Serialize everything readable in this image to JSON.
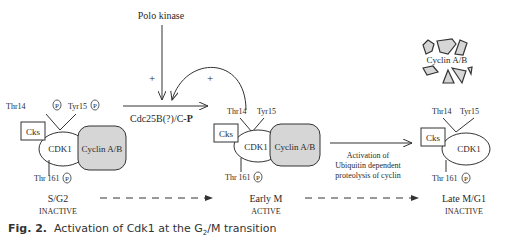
{
  "figure": {
    "caption": {
      "label": "Fig. 2.",
      "text_before": "Activation of Cdk1 at the G",
      "subscript": "2",
      "text_after": "/M transition"
    },
    "regulators": {
      "polo_kinase": "Polo kinase",
      "phosphatase": "Cdc25B(?)/C-",
      "phosphatase_bold": "P",
      "plus_left": "+",
      "plus_right": "+"
    },
    "complexes": [
      {
        "id": "s-g2",
        "thr14": "Thr14",
        "tyr15": "Tyr15",
        "thr161": "Thr 161",
        "phospho": "P",
        "cks": "Cks",
        "cdk": "CDK1",
        "cyclin": "Cyclin A/B",
        "phase": "S/G2",
        "state": "INACTIVE"
      },
      {
        "id": "early-m",
        "thr14": "Thr14",
        "tyr15": "Tyr15",
        "thr161": "Thr 161",
        "phospho": "P",
        "cks": "Cks",
        "cdk": "CDK1",
        "cyclin": "Cyclin A/B",
        "phase": "Early M",
        "state": "ACTIVE"
      },
      {
        "id": "late-m-g1",
        "thr14": "Thr14",
        "tyr15": "Tyr15",
        "thr161": "Thr 161",
        "phospho": "P",
        "cks": "Cks",
        "cdk": "CDK1",
        "phase": "Late M/G1",
        "state": "INACTIVE"
      }
    ],
    "degradation": {
      "line1": "Activation of",
      "line2": "Ubiquitin dependent",
      "line3": "proteolysis of cyclin",
      "fragments_label": "Cyclin A/B"
    },
    "colors": {
      "cyclin_fill": "#d6d6d6",
      "stroke": "#333333"
    }
  }
}
